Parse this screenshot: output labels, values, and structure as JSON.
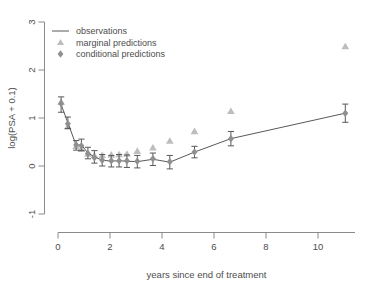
{
  "chart_data": {
    "type": "line",
    "title": "",
    "subtitle": "",
    "xlabel": "years since end of treatment",
    "ylabel": "log(PSA + 0.1)",
    "xlim": [
      -0.55,
      11.9
    ],
    "ylim": [
      -1.25,
      3.2
    ],
    "xticks": [
      0,
      2,
      4,
      6,
      8,
      10
    ],
    "xtick_labels": [
      "0",
      "2",
      "4",
      "6",
      "8",
      "10"
    ],
    "yticks": [
      -1,
      0,
      1,
      2,
      3
    ],
    "ytick_labels": [
      "-1",
      "0",
      "1",
      "2",
      "3"
    ],
    "grid": false,
    "legend_position": "top-left",
    "legend": [
      {
        "label": "observations",
        "marker": "line",
        "color": "#595959"
      },
      {
        "label": "marginal predictions",
        "marker": "triangle",
        "color": "#bdbdbd"
      },
      {
        "label": "conditional predictions",
        "marker": "diamond",
        "color": "#8f8f8f"
      }
    ],
    "series": [
      {
        "name": "observations",
        "marker": "line-errorbar",
        "color": "#595959",
        "x": [
          0.12,
          0.38,
          0.7,
          0.9,
          1.15,
          1.4,
          1.7,
          2.05,
          2.35,
          2.65,
          3.05,
          3.65,
          4.3,
          5.25,
          6.65,
          11.05
        ],
        "y": [
          1.28,
          0.9,
          0.43,
          0.44,
          0.27,
          0.19,
          0.12,
          0.1,
          0.11,
          0.1,
          0.09,
          0.14,
          0.08,
          0.29,
          0.57,
          1.1
        ],
        "yerr_low": [
          1.12,
          0.78,
          0.33,
          0.32,
          0.15,
          0.06,
          0.0,
          -0.02,
          -0.02,
          -0.03,
          -0.04,
          0.01,
          -0.06,
          0.17,
          0.42,
          0.91
        ],
        "yerr_high": [
          1.44,
          1.02,
          0.53,
          0.56,
          0.39,
          0.32,
          0.24,
          0.22,
          0.24,
          0.23,
          0.22,
          0.27,
          0.22,
          0.41,
          0.72,
          1.29
        ]
      },
      {
        "name": "marginal predictions",
        "marker": "triangle",
        "color": "#bdbdbd",
        "x": [
          0.12,
          0.38,
          0.7,
          0.9,
          1.15,
          1.4,
          1.7,
          2.05,
          2.35,
          2.65,
          3.05,
          3.65,
          4.3,
          5.25,
          6.65,
          11.05
        ],
        "y": [
          1.33,
          0.82,
          0.41,
          0.35,
          0.25,
          0.22,
          0.22,
          0.23,
          0.24,
          0.25,
          0.31,
          0.38,
          0.52,
          0.72,
          1.14,
          2.49
        ]
      },
      {
        "name": "conditional predictions",
        "marker": "diamond",
        "color": "#8f8f8f",
        "x": [
          0.12,
          0.38,
          0.7,
          0.9,
          1.15,
          1.4,
          1.7,
          2.05,
          2.35,
          2.65,
          3.05,
          3.65,
          4.3,
          5.25,
          6.65,
          11.05
        ],
        "y": [
          1.3,
          0.88,
          0.44,
          0.42,
          0.26,
          0.17,
          0.12,
          0.11,
          0.11,
          0.11,
          0.1,
          0.15,
          0.09,
          0.29,
          0.57,
          1.1
        ]
      }
    ]
  }
}
